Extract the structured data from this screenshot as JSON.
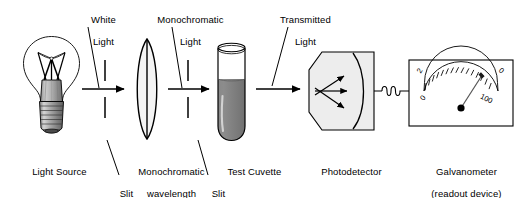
{
  "diagram": {
    "background_color": "#ffffff",
    "ink_color": "#000000",
    "width": 523,
    "height": 198
  },
  "top_labels": [
    {
      "name": "white-light",
      "line1": "White",
      "line2": "Light"
    },
    {
      "name": "monochromatic-light",
      "line1": "Monochromatic",
      "line2": "Light"
    },
    {
      "name": "transmitted-light",
      "line1": "Transmitted",
      "line2": "Light"
    }
  ],
  "bottom_labels": [
    {
      "name": "light-source",
      "line1": "Light Source",
      "line2": "",
      "line3": ""
    },
    {
      "name": "slit-left",
      "line1": "Slit",
      "line2": "",
      "line3": ""
    },
    {
      "name": "monochromatic-wavelength-selector",
      "line1": "Monochromatic",
      "line2": "wavelength",
      "line3": "selector"
    },
    {
      "name": "slit-right",
      "line1": "Slit",
      "line2": "",
      "line3": ""
    },
    {
      "name": "test-cuvette",
      "line1": "Test Cuvette",
      "line2": "",
      "line3": ""
    },
    {
      "name": "photodetector",
      "line1": "Photodetector",
      "line2": "",
      "line3": ""
    },
    {
      "name": "galvanometer",
      "line1": "Galvanometer",
      "line2": "(readout device)",
      "line3": ""
    }
  ],
  "components": {
    "light_source": {
      "type": "incandescent-bulb",
      "glass_color": "#ffffff",
      "neck_color": "#b3b3b3",
      "base_color": "#9a9a9a",
      "filament_color": "#000000"
    },
    "slit_left": {
      "type": "slit",
      "gap": "center"
    },
    "lens": {
      "type": "biconvex-lens",
      "fill_color": "#f2f2f2",
      "has_center_line": true
    },
    "slit_right": {
      "type": "slit",
      "gap": "center"
    },
    "cuvette": {
      "type": "round-bottom-tube",
      "liquid_color": "#808080",
      "glass_color": "#ffffff",
      "fill_level_percent": 65
    },
    "photodetector": {
      "type": "pentagon-housing",
      "fill_color": "#ededed",
      "internal_arrow_count": 3,
      "has_curved_face": true
    },
    "wire": {
      "type": "coiled-wire",
      "coil_count": 3
    },
    "galvanometer": {
      "type": "analog-meter",
      "case_fill": "#ffffff",
      "needle_color": "#4d4d4d",
      "pivot_color": "#000000",
      "tick_count": 18,
      "scale_labels": {
        "upper_left": "2",
        "lower_left": "0",
        "upper_right": "0",
        "lower_right": "100"
      }
    }
  },
  "beam_arrows": [
    {
      "name": "beam-source-to-lens"
    },
    {
      "name": "beam-lens-to-cuvette"
    },
    {
      "name": "beam-cuvette-to-detector"
    }
  ]
}
